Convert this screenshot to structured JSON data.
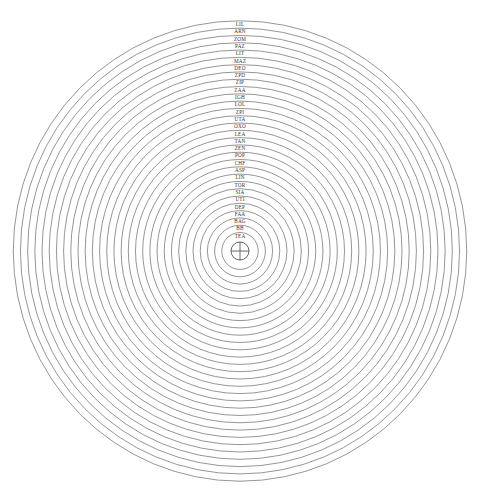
{
  "diagram": {
    "type": "concentric-rings",
    "center": {
      "x": 240,
      "y": 251
    },
    "ring_spacing": 7.3,
    "innermost_radius": 9,
    "stroke_color": "#8a8a8a",
    "label_color": "#333333",
    "rings_outer_to_inner": [
      "LIL",
      "ARN",
      "ZOM",
      "PAZ",
      "LIT",
      "MAZ",
      "DEO",
      "ZPD",
      "ZIP",
      "ZAA",
      "IGH",
      "LOL",
      "ZPI",
      "UTA",
      "OXO",
      "LEA",
      "TAN",
      "ZEN",
      "POP",
      "CHF",
      "ASP",
      "LIN",
      "TOR",
      "SIA",
      "UTI",
      "DEP",
      "FAA",
      "BAG",
      "BB",
      "TEA"
    ],
    "center_marker": "crosshair-circle"
  }
}
